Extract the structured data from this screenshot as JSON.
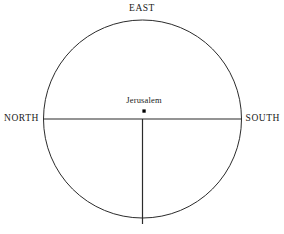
{
  "diagram": {
    "type": "t-o-map",
    "background_color": "#ffffff",
    "stroke_color": "#2b2b2b",
    "text_color": "#1a1a1a",
    "circle": {
      "center_x": 142.5,
      "center_y": 119,
      "radius": 99,
      "stroke_width": 1
    },
    "lines": [
      {
        "name": "horizontal-diameter",
        "x1": 43.5,
        "y1": 119,
        "x2": 241.5,
        "y2": 119,
        "stroke_width": 1.2
      },
      {
        "name": "vertical-radius",
        "x1": 142.5,
        "y1": 119,
        "x2": 142.5,
        "y2": 224,
        "stroke_width": 1.2
      }
    ],
    "center_marker": {
      "name": "jerusalem-dot",
      "x": 144,
      "y": 111,
      "size": 3.2,
      "color": "#000000"
    },
    "labels": {
      "east": "EAST",
      "north": "NORTH",
      "south": "SOUTH",
      "jerusalem": "Jerusalem"
    }
  }
}
